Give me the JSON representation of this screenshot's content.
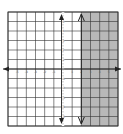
{
  "chart_data": {
    "type": "line",
    "title": "",
    "xlabel": "",
    "ylabel": "",
    "xlim": [
      -6,
      6
    ],
    "ylim": [
      -6,
      6
    ],
    "grid": true,
    "x_ticks": [
      -5,
      -4,
      -3,
      -2,
      -1,
      0,
      1,
      2,
      3,
      4,
      5
    ],
    "y_ticks": [
      -5,
      -4,
      -3,
      -2,
      -1,
      0,
      1,
      2,
      3,
      4,
      5
    ],
    "boundary": {
      "type": "vertical",
      "x": 2,
      "style": "solid"
    },
    "shaded_region": "x > 2",
    "inequality": "x ≥ 2",
    "colors": {
      "shade": "#b8b8b8",
      "grid": "#333333",
      "axis": "#222222"
    }
  }
}
